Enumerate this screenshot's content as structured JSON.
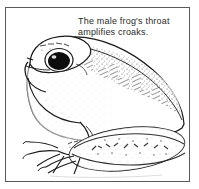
{
  "figure": {
    "kind": "line-drawing-illustration",
    "subject": "frog",
    "frame": {
      "border_color": "#5a5a5a",
      "background_color": "#ffffff"
    },
    "caption": {
      "line1": "The male frog's throat",
      "line2": "amplifies croaks.",
      "full_text": "The male frog's throat amplifies croaks.",
      "color": "#2b2b2b"
    },
    "ink_color": "#1a1a1a",
    "parts": [
      {
        "name": "head",
        "label": "head"
      },
      {
        "name": "eye",
        "label": "eye"
      },
      {
        "name": "nostril",
        "label": "nostril"
      },
      {
        "name": "throat",
        "label": "throat"
      },
      {
        "name": "back",
        "label": "back"
      },
      {
        "name": "belly",
        "label": "belly"
      },
      {
        "name": "front-leg",
        "label": "front leg"
      },
      {
        "name": "front-foot",
        "label": "front foot"
      },
      {
        "name": "hind-leg",
        "label": "hind leg"
      },
      {
        "name": "hind-foot",
        "label": "hind foot"
      }
    ]
  }
}
